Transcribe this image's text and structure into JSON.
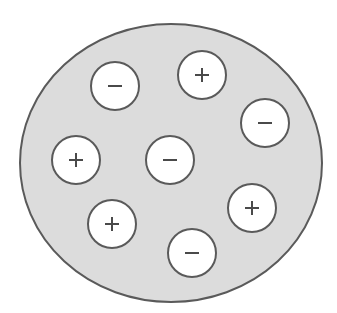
{
  "diagram": {
    "title": "",
    "background_color": "#ffffff",
    "sphere": {
      "cx": 171,
      "cy": 163,
      "rx": 151,
      "ry": 139,
      "fill": "#dcdcdc",
      "stroke": "#5a5a5a"
    },
    "particle_style": {
      "r": 24,
      "fill": "#ffffff",
      "stroke": "#5a5a5a",
      "sign_color": "#4a4a4a"
    },
    "particles": [
      {
        "charge": "negative",
        "symbol": "−",
        "cx": 115,
        "cy": 86
      },
      {
        "charge": "positive",
        "symbol": "+",
        "cx": 202,
        "cy": 75
      },
      {
        "charge": "negative",
        "symbol": "−",
        "cx": 265,
        "cy": 123
      },
      {
        "charge": "positive",
        "symbol": "+",
        "cx": 76,
        "cy": 160
      },
      {
        "charge": "negative",
        "symbol": "−",
        "cx": 170,
        "cy": 160
      },
      {
        "charge": "positive",
        "symbol": "+",
        "cx": 252,
        "cy": 208
      },
      {
        "charge": "positive",
        "symbol": "+",
        "cx": 112,
        "cy": 224
      },
      {
        "charge": "negative",
        "symbol": "−",
        "cx": 192,
        "cy": 253
      }
    ],
    "counts": {
      "positive": 4,
      "negative": 4
    }
  }
}
